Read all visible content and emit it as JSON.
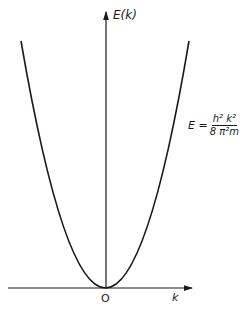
{
  "figure": {
    "y_axis_label": "E(k)",
    "x_axis_label": "k",
    "origin_label": "O",
    "formula": {
      "lhs": "E =",
      "numerator": "h² k²",
      "denominator": "8 π²m"
    },
    "curve": "parabola",
    "colors": {
      "line": "#1a1a1a",
      "background": "#ffffff"
    }
  }
}
